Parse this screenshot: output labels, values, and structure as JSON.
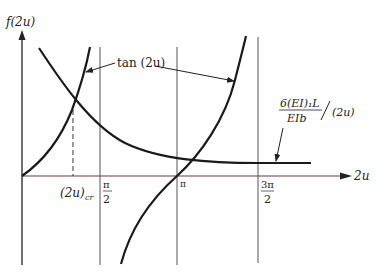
{
  "diagram": {
    "y_axis_label": "f(2u)",
    "x_axis_label": "2u",
    "curve_tan_label": "tan (2u)",
    "curve_ratio_label": {
      "numerator": "6(EI)₁L",
      "denominator": "EIb",
      "suffix": "(2u)"
    },
    "ticks": {
      "critical": "(2u)",
      "critical_sub": "cr",
      "half_pi_num": "π",
      "half_pi_den": "2",
      "pi": "π",
      "three_half_pi_num": "3π",
      "three_half_pi_den": "2"
    }
  },
  "colors": {
    "curve": "#1a1a1a",
    "axis": "#333333",
    "x_axis": "#6a3a3a",
    "gridline": "#555555"
  }
}
